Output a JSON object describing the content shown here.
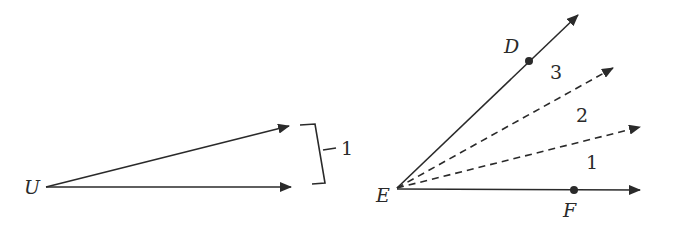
{
  "left_figure": {
    "vertex_label": "U",
    "bracket_label": "1"
  },
  "right_figure": {
    "vertex_label": "E",
    "point_top_label": "D",
    "point_bottom_label": "F",
    "sector_labels": [
      "1",
      "2",
      "3"
    ]
  },
  "colors": {
    "stroke": "#2a2a2a",
    "background": "#ffffff"
  }
}
